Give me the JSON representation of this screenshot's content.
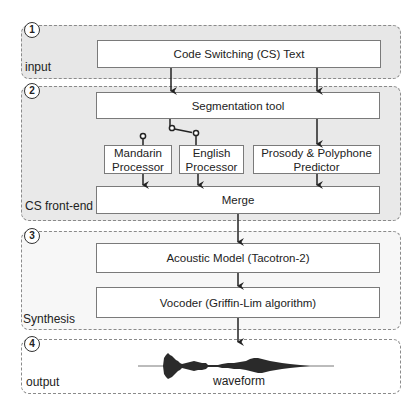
{
  "panels": [
    {
      "number": "1",
      "label": "input"
    },
    {
      "number": "2",
      "label": "CS front-end"
    },
    {
      "number": "3",
      "label": "Synthesis"
    },
    {
      "number": "4",
      "label": "output"
    }
  ],
  "input": {
    "cs_text": "Code Switching (CS) Text"
  },
  "frontend": {
    "segmentation": "Segmentation tool",
    "mandarin": "Mandarin Processor",
    "english": "English Processor",
    "prosody": "Prosody & Polyphone Predictor",
    "merge": "Merge"
  },
  "synthesis": {
    "acoustic": "Acoustic Model (Tacotron-2)",
    "vocoder": "Vocoder (Griffin-Lim algorithm)"
  },
  "output": {
    "waveform_label": "waveform"
  },
  "colors": {
    "panel_fill": "#e8e8e8",
    "panel_border": "#8a8a8a",
    "box_border": "#7a7a7a",
    "line": "#222222"
  }
}
